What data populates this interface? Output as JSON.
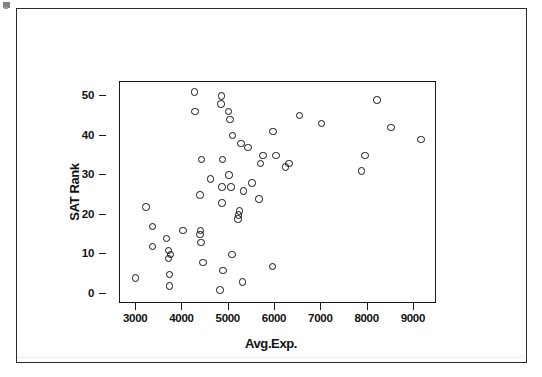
{
  "figure": {
    "name": "sat-rank-vs-avg-exp-scatterplot",
    "xaxis_title": "Avg.Exp.",
    "yaxis_title": "SAT Rank"
  },
  "chart_data": {
    "type": "scatter",
    "title": "",
    "xlabel": "Avg.Exp.",
    "ylabel": "SAT Rank",
    "xlim": [
      2650,
      9500
    ],
    "ylim": [
      -2.5,
      53.5
    ],
    "xticks": [
      3000,
      4000,
      5000,
      6000,
      7000,
      8000,
      9000
    ],
    "xtick_labels": [
      "3000",
      "4000",
      "5000",
      "6000",
      "7000",
      "8000",
      "9000"
    ],
    "yticks": [
      0,
      10,
      20,
      30,
      40,
      50
    ],
    "ytick_labels": [
      "0",
      "10",
      "20",
      "30",
      "40",
      "50"
    ],
    "grid": false,
    "legend": false,
    "marker": "open-circle",
    "marker_color": "#111111",
    "n_points": 51,
    "x": [
      2990,
      3210,
      3350,
      3350,
      3660,
      3700,
      3700,
      3720,
      3720,
      3740,
      4010,
      4260,
      4270,
      4380,
      4380,
      4390,
      4400,
      4410,
      4440,
      4610,
      4810,
      4830,
      4840,
      4850,
      4850,
      4860,
      4880,
      4990,
      5010,
      5030,
      5050,
      5070,
      5080,
      5200,
      5210,
      5230,
      5260,
      5300,
      5320,
      5420,
      5500,
      5650,
      5690,
      5740,
      5950,
      5960,
      6020,
      6230,
      6300,
      6530,
      7000,
      7870,
      7940,
      8200,
      8510,
      9150
    ],
    "y": [
      4,
      22,
      12,
      17,
      14,
      9,
      11,
      2,
      5,
      10,
      16,
      51,
      46,
      25,
      15,
      16,
      13,
      34,
      8,
      29,
      1,
      48,
      50,
      23,
      27,
      34,
      6,
      46,
      30,
      44,
      27,
      10,
      40,
      19,
      20,
      21,
      38,
      3,
      26,
      37,
      28,
      24,
      33,
      35,
      7,
      41,
      35,
      32,
      33,
      45,
      43,
      31,
      35,
      49,
      42,
      39
    ],
    "annotations": []
  }
}
